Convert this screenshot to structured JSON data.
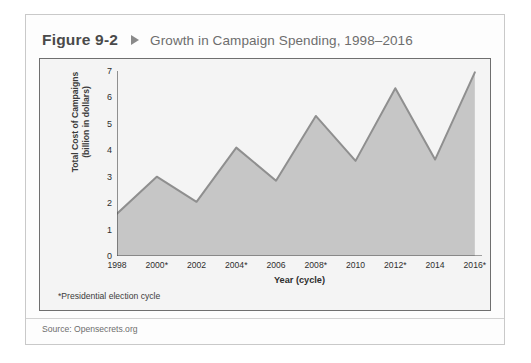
{
  "figure": {
    "number": "Figure 9-2",
    "marker_icon": "triangle-right-icon",
    "title": "Growth in Campaign Spending, 1998–2016",
    "footnote": "*Presidential election cycle",
    "source": "Source: Opensecrets.org"
  },
  "colors": {
    "card_border": "#c9c9c9",
    "chart_border": "#6f6f6f",
    "chart_background": "#f4f4f4",
    "area_fill": "#c6c6c6",
    "line": "#8f8f8f",
    "axis": "#4a4a4a",
    "caption_number": "#4a4a4a",
    "caption_title": "#6d6d6d"
  },
  "chart_data": {
    "type": "area",
    "title": "Growth in Campaign Spending, 1998–2016",
    "xlabel": "Year (cycle)",
    "ylabel": "Total Cost of Campaigns (billion in dollars)",
    "ylabel_line1": "Total Cost of Campaigns",
    "ylabel_line2": "(billion in dollars)",
    "categories": [
      "1998",
      "2000*",
      "2002",
      "2004*",
      "2006",
      "2008*",
      "2010",
      "2012*",
      "2014",
      "2016*"
    ],
    "x": [
      1998,
      2000,
      2002,
      2004,
      2006,
      2008,
      2010,
      2012,
      2014,
      2016
    ],
    "values": [
      1.6,
      3.0,
      2.05,
      4.1,
      2.85,
      5.3,
      3.6,
      6.35,
      3.65,
      6.95
    ],
    "ylim": [
      0,
      7
    ],
    "yticks": [
      0,
      1,
      2,
      3,
      4,
      5,
      6,
      7
    ],
    "ytick_labels": [
      "0",
      "1",
      "2",
      "3",
      "4",
      "5",
      "6",
      "7"
    ],
    "grid": false,
    "legend": false,
    "annotations": [
      "*Presidential election cycle"
    ]
  }
}
